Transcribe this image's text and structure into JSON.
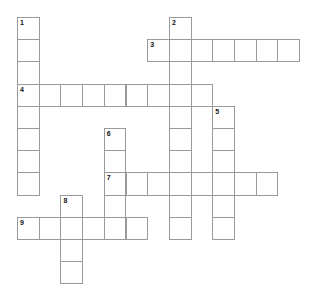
{
  "puzzle": {
    "type": "crossword",
    "grid": {
      "origin_x": 17,
      "origin_y": 17,
      "cell_w": 21.7,
      "cell_h": 22.2,
      "line_color": "#9a9a9a"
    },
    "words": [
      {
        "number": "1",
        "direction": "down",
        "row": 0,
        "col": 0,
        "length": 8
      },
      {
        "number": "2",
        "direction": "down",
        "row": 0,
        "col": 7,
        "length": 10
      },
      {
        "number": "3",
        "direction": "across",
        "row": 1,
        "col": 6,
        "length": 7
      },
      {
        "number": "4",
        "direction": "across",
        "row": 3,
        "col": 0,
        "length": 9
      },
      {
        "number": "5",
        "direction": "down",
        "row": 4,
        "col": 9,
        "length": 6
      },
      {
        "number": "6",
        "direction": "down",
        "row": 5,
        "col": 4,
        "length": 5
      },
      {
        "number": "7",
        "direction": "across",
        "row": 7,
        "col": 4,
        "length": 8
      },
      {
        "number": "8",
        "direction": "down",
        "row": 8,
        "col": 2,
        "length": 4
      },
      {
        "number": "9",
        "direction": "across",
        "row": 9,
        "col": 0,
        "length": 6
      }
    ]
  }
}
